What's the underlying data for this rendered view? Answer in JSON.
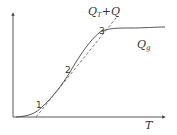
{
  "diagram": {
    "x_axis_label": "T",
    "curve_label_main": "Q",
    "curve_label_sub": "g",
    "line_label_main": "Q",
    "line_label_sub": "T",
    "line_label_suffix": "+Q",
    "points": [
      {
        "label": "1"
      },
      {
        "label": "2"
      },
      {
        "label": "3"
      }
    ],
    "colors": {
      "curve": "#444444",
      "line": "#555555",
      "axis": "#444444"
    }
  }
}
